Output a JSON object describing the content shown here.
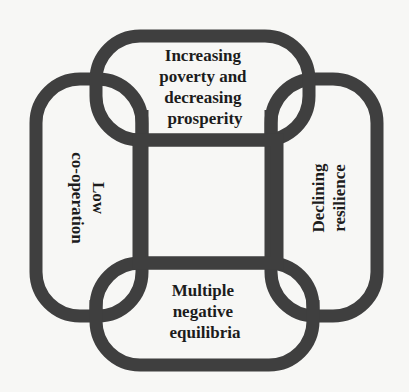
{
  "diagram": {
    "type": "interlocking-rings",
    "nodes": [
      {
        "id": "top",
        "lines": [
          "Increasing",
          "poverty and",
          "decreasing",
          "prosperity"
        ]
      },
      {
        "id": "right",
        "lines": [
          "Declining",
          "resilience"
        ]
      },
      {
        "id": "bottom",
        "lines": [
          "Multiple",
          "negative",
          "equilibria"
        ]
      },
      {
        "id": "left",
        "lines": [
          "Low",
          "co-operation"
        ]
      }
    ],
    "colors": {
      "ring": "#3f3f3f",
      "text": "#1c1c1c",
      "background": "#f7f7f5"
    }
  }
}
